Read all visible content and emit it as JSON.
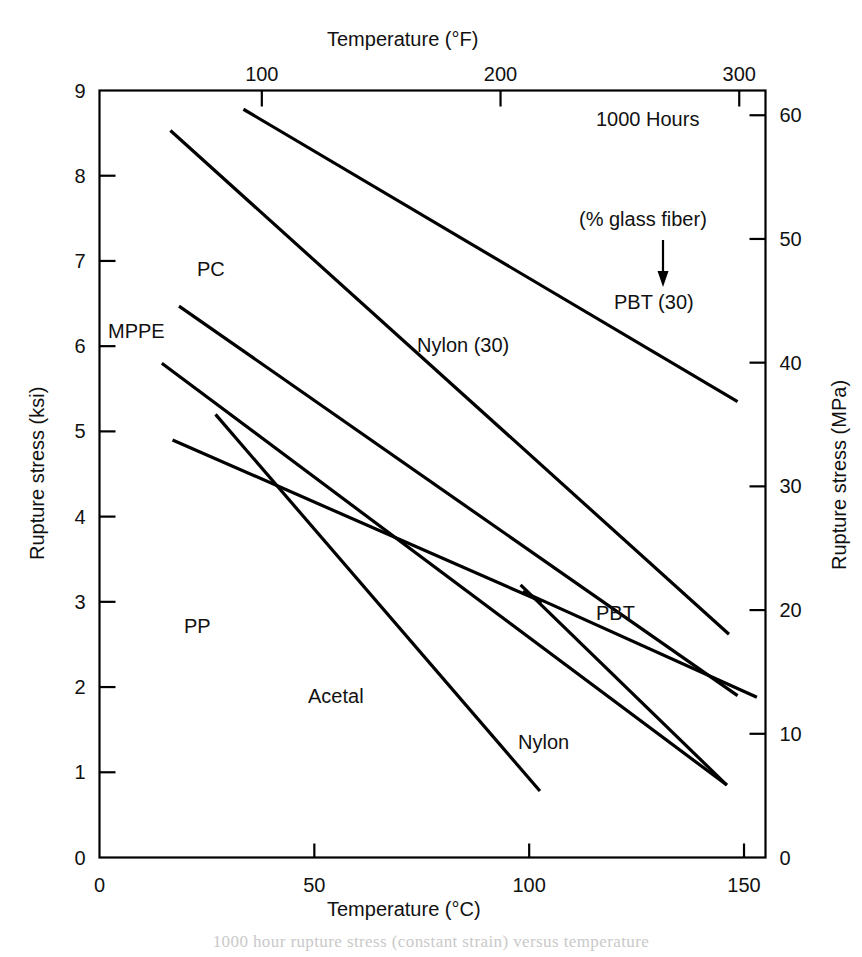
{
  "chart_data": {
    "type": "line",
    "title": "",
    "xlabel": "Temperature (°C)",
    "ylabel": "Rupture stress (ksi)",
    "xlabel_top": "Temperature (°F)",
    "ylabel_right": "Rupture stress (MPa)",
    "xlim": [
      0,
      155
    ],
    "ylim": [
      0,
      9
    ],
    "xlim_top_f": [
      32,
      311
    ],
    "ylim_right_mpa": [
      0,
      62
    ],
    "xticks": [
      0,
      50,
      100,
      150
    ],
    "xticklabels": [
      "0",
      "50",
      "100",
      "150"
    ],
    "xticks_top_f": [
      100,
      200,
      300
    ],
    "xticklabels_top": [
      "100",
      "200",
      "300"
    ],
    "yticks": [
      0,
      1,
      2,
      3,
      4,
      5,
      6,
      7,
      8,
      9
    ],
    "yticklabels": [
      "0",
      "1",
      "2",
      "3",
      "4",
      "5",
      "6",
      "7",
      "8",
      "9"
    ],
    "yticks_right_mpa": [
      0,
      10,
      20,
      30,
      40,
      50,
      60
    ],
    "yticklabels_right": [
      "0",
      "10",
      "20",
      "30",
      "40",
      "50",
      "60"
    ],
    "grid": false,
    "legend": "inline-labels",
    "line_color": "#000000",
    "series": [
      {
        "name": "PBT (30)",
        "label": "PBT (30)",
        "x": [
          33.5,
          148.5
        ],
        "y": [
          8.78,
          5.35
        ]
      },
      {
        "name": "Nylon (30)",
        "label": "Nylon (30)",
        "x": [
          16.5,
          146.5
        ],
        "y": [
          8.53,
          2.62
        ]
      },
      {
        "name": "PC",
        "label": "PC",
        "x": [
          18.5,
          148.5
        ],
        "y": [
          6.47,
          1.9
        ]
      },
      {
        "name": "MPPE",
        "label": "MPPE",
        "x": [
          14.5,
          146.0
        ],
        "y": [
          5.8,
          0.85
        ]
      },
      {
        "name": "PP",
        "label": "PP",
        "x": [
          17.0,
          103.0
        ],
        "y": [
          4.9,
          3.0
        ]
      },
      {
        "name": "Acetal",
        "label": "Acetal",
        "x": [
          27.0,
          102.5
        ],
        "y": [
          5.2,
          0.78
        ]
      },
      {
        "name": "PBT",
        "label": "PBT",
        "x": [
          98.5,
          153.0
        ],
        "y": [
          3.12,
          1.88
        ]
      },
      {
        "name": "Nylon",
        "label": "Nylon",
        "x": [
          98.0,
          146.0
        ],
        "y": [
          3.2,
          0.85
        ]
      }
    ],
    "annotations": [
      {
        "name": "duration-note",
        "text": "1000 Hours"
      },
      {
        "name": "glass-fiber-note",
        "text": "(% glass fiber)"
      }
    ]
  },
  "axes": {
    "top_title": "Temperature (°F)",
    "bottom_title": "Temperature (°C)",
    "left_title": "Rupture stress (ksi)",
    "right_title": "Rupture stress (MPa)"
  },
  "caption": {
    "text": "1000 hour rupture stress (constant strain) versus temperature"
  }
}
